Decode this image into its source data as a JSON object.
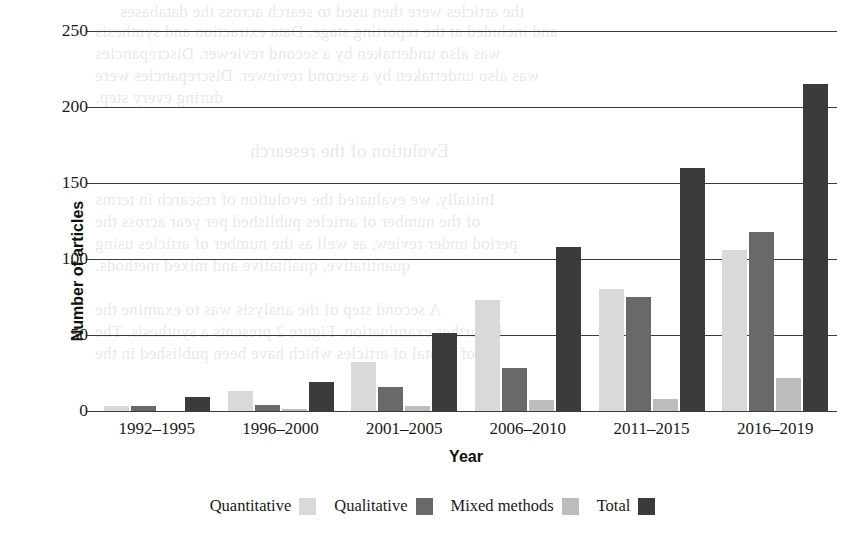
{
  "chart_data": {
    "type": "bar",
    "title": "",
    "xlabel": "Year",
    "ylabel": "Number of articles",
    "categories": [
      "1992–1995",
      "1996–2000",
      "2001–2005",
      "2006–2010",
      "2011–2015",
      "2016–2019"
    ],
    "series": [
      {
        "name": "Quantitative",
        "color": "#d9d9d9",
        "values": [
          3,
          13,
          32,
          73,
          80,
          106
        ]
      },
      {
        "name": "Qualitative",
        "color": "#696969",
        "values": [
          3,
          4,
          16,
          28,
          75,
          118
        ]
      },
      {
        "name": "Mixed methods",
        "color": "#bdbdbd",
        "values": [
          0,
          1,
          3,
          7,
          8,
          22
        ]
      },
      {
        "name": "Total",
        "color": "#3b3b3b",
        "values": [
          9,
          19,
          51,
          108,
          160,
          215
        ]
      }
    ],
    "ylim": [
      0,
      250
    ],
    "yticks": [
      0,
      50,
      100,
      150,
      200,
      250
    ],
    "ytick_labels": [
      "0",
      "50",
      "100",
      "150",
      "200",
      "250"
    ],
    "grid": true,
    "legend_position": "bottom"
  },
  "legend": {
    "items": [
      {
        "label": "Quantitative",
        "color": "#d9d9d9"
      },
      {
        "label": "Qualitative",
        "color": "#696969"
      },
      {
        "label": "Mixed methods",
        "color": "#bdbdbd"
      },
      {
        "label": "Total",
        "color": "#3b3b3b"
      }
    ]
  },
  "background_text": {
    "lines": [
      "the articles in the full-text screening process were included",
      "and included in the systematic review of this systematic",
      "reviews of the quality, the data extraction and the synthesis",
      "was also undertaken by a second reviewer. Discrepancies",
      "during every step."
    ]
  }
}
